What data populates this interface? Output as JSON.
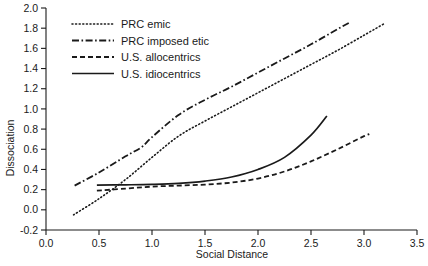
{
  "chart_data": {
    "type": "line",
    "title": "",
    "xlabel": "Social Distance",
    "ylabel": "Dissociation",
    "xlim": [
      0.0,
      3.5
    ],
    "ylim": [
      -0.2,
      2.0
    ],
    "grid": false,
    "legend_position": "top-left",
    "xticks": [
      "0.0",
      "0.5",
      "1.0",
      "1.5",
      "2.0",
      "2.5",
      "3.0",
      "3.5"
    ],
    "xtick_values": [
      0.0,
      0.5,
      1.0,
      1.5,
      2.0,
      2.5,
      3.0,
      3.5
    ],
    "yticks": [
      "-0.2",
      "0.0",
      "0.2",
      "0.4",
      "0.6",
      "0.8",
      "1.0",
      "1.2",
      "1.4",
      "1.6",
      "1.8",
      "2.0"
    ],
    "ytick_values": [
      -0.2,
      0.0,
      0.2,
      0.4,
      0.6,
      0.8,
      1.0,
      1.2,
      1.4,
      1.6,
      1.8,
      2.0
    ],
    "series": [
      {
        "name": "PRC emic",
        "style": "dotted",
        "color": "#1a1a1a",
        "x": [
          0.26,
          0.5,
          0.75,
          1.0,
          1.25,
          1.5,
          1.75,
          2.0,
          2.25,
          2.5,
          2.75,
          3.0,
          3.2
        ],
        "values": [
          -0.05,
          0.11,
          0.3,
          0.52,
          0.73,
          0.88,
          1.02,
          1.16,
          1.3,
          1.44,
          1.58,
          1.73,
          1.85
        ]
      },
      {
        "name": "PRC imposed etic",
        "style": "dash-dot",
        "color": "#1a1a1a",
        "x": [
          0.27,
          0.5,
          0.75,
          0.9,
          1.0,
          1.25,
          1.5,
          1.75,
          2.0,
          2.25,
          2.5,
          2.75,
          2.87
        ],
        "values": [
          0.24,
          0.37,
          0.53,
          0.62,
          0.72,
          0.94,
          1.09,
          1.22,
          1.36,
          1.5,
          1.64,
          1.79,
          1.86
        ]
      },
      {
        "name": "U.S. allocentrics",
        "style": "dashed",
        "color": "#1a1a1a",
        "x": [
          0.48,
          0.75,
          1.0,
          1.25,
          1.5,
          1.75,
          2.0,
          2.25,
          2.5,
          2.75,
          3.0,
          3.05
        ],
        "values": [
          0.19,
          0.21,
          0.23,
          0.24,
          0.25,
          0.27,
          0.31,
          0.38,
          0.48,
          0.6,
          0.73,
          0.75
        ]
      },
      {
        "name": "U.S. idiocentrics",
        "style": "solid",
        "color": "#1a1a1a",
        "x": [
          0.48,
          0.75,
          1.0,
          1.25,
          1.5,
          1.75,
          2.0,
          2.25,
          2.5,
          2.65
        ],
        "values": [
          0.245,
          0.248,
          0.252,
          0.262,
          0.285,
          0.325,
          0.4,
          0.52,
          0.74,
          0.93
        ]
      }
    ]
  },
  "axes": {
    "y_title": "Dissociation",
    "x_title": "Social Distance",
    "x_tick_labels": [
      "0.0",
      "0.5",
      "1.0",
      "1.5",
      "2.0",
      "2.5",
      "3.0",
      "3.5"
    ],
    "y_tick_labels": [
      "2.0",
      "1.8",
      "1.6",
      "1.4",
      "1.2",
      "1.0",
      "0.8",
      "0.6",
      "0.4",
      "0.2",
      "0.0",
      "-0.2"
    ]
  },
  "legend": {
    "items": [
      {
        "label": "PRC emic",
        "style": "dotted"
      },
      {
        "label": "PRC imposed etic",
        "style": "dash-dot"
      },
      {
        "label": "U.S. allocentrics",
        "style": "dashed"
      },
      {
        "label": "U.S. idiocentrics",
        "style": "solid"
      }
    ]
  }
}
